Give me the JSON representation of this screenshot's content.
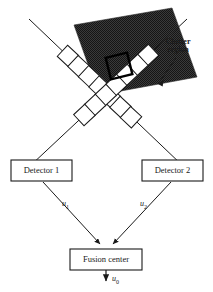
{
  "figure": {
    "colors": {
      "line": "#1a1a1a",
      "clutter_fill": "#3d3d3d",
      "background": "#ffffff",
      "cell_stroke": "#1a1a1a",
      "highlight_stroke": "#000000"
    }
  },
  "annotations": {
    "clutter_line1": "Clutter",
    "clutter_line2": "region"
  },
  "nodes": {
    "detector1": "Detector 1",
    "detector2": "Detector 2",
    "fusion": "Fusion center"
  },
  "messages": {
    "u1_base": "u",
    "u1_sub": "1",
    "u2_base": "u",
    "u2_sub": "2",
    "u0_base": "u",
    "u0_sub": "0"
  },
  "diagram_data": {
    "type": "diagram",
    "sensor_beams": [
      {
        "name": "beam-left-to-right",
        "from": [
          29,
          19
        ],
        "to": [
          183,
          167
        ],
        "cell_count": 7
      },
      {
        "name": "beam-right-to-left",
        "from": [
          186,
          20
        ],
        "to": [
          30,
          165
        ],
        "cell_count": 7
      }
    ],
    "clutter_band": {
      "rotation_deg": -57,
      "corners": [
        [
          74,
          24
        ],
        [
          172,
          8
        ],
        [
          197,
          77
        ],
        [
          99,
          96
        ]
      ]
    },
    "highlighted_cell": {
      "center": [
        117,
        65
      ],
      "size": 20
    },
    "edges": [
      {
        "from": "detector1",
        "to": "fusion",
        "label": "u1"
      },
      {
        "from": "detector2",
        "to": "fusion",
        "label": "u2"
      },
      {
        "from": "fusion",
        "to": "decision",
        "label": "u0"
      }
    ]
  }
}
